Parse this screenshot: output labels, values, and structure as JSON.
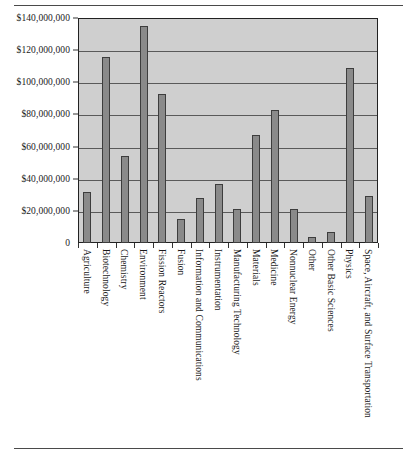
{
  "chart_data": {
    "type": "bar",
    "title": "",
    "subtitle": "",
    "xlabel": "",
    "ylabel": "",
    "ylim": [
      0,
      140000000
    ],
    "grid": true,
    "legend_position": "none",
    "orientation": "vertical",
    "bar_color": "#8a8a8a",
    "bar_border_color": "#3d3d3d",
    "plot_background": "#cfcfcf",
    "categories": [
      "Agriculture",
      "Biotechnology",
      "Chemistry",
      "Environment",
      "Fission Reactors",
      "Fusion",
      "Information and Communications",
      "Instrumentation",
      "Manufacturing Technology",
      "Materials",
      "Medicine",
      "Nonnuclear Energy",
      "Other",
      "Other Basic Sciences",
      "Physics",
      "Space, Aircraft, and Surface Transportation"
    ],
    "values": [
      32000000,
      116000000,
      54000000,
      135000000,
      93000000,
      15000000,
      28000000,
      37000000,
      21000000,
      67000000,
      83000000,
      21000000,
      4000000,
      7000000,
      109000000,
      29000000
    ],
    "yticks": [
      0,
      20000000,
      40000000,
      60000000,
      80000000,
      100000000,
      120000000,
      140000000
    ],
    "ytick_labels": [
      "0",
      "$20,000,000",
      "$40,000,000",
      "$60,000,000",
      "$80,000,000",
      "$100,000,000",
      "$120,000,000",
      "$140,000,000"
    ]
  }
}
